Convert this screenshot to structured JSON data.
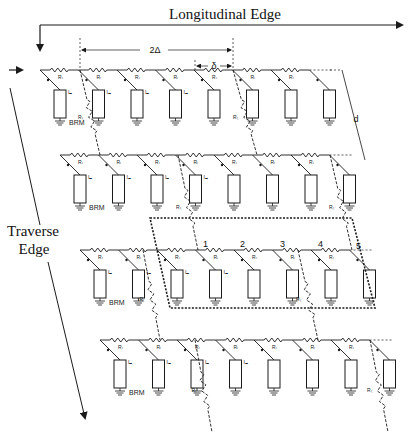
{
  "labels": {
    "longitudinal_edge": "Longitudinal Edge",
    "traverse_edge_line1": "Traverse",
    "traverse_edge_line2": "Edge",
    "dim_2delta": "2Δ",
    "dim_delta": "δ",
    "dim_d": "d",
    "brm": "BRM",
    "resistor_long": "Rₗ",
    "resistor_trans": "Rₜ",
    "current": "Iₘ"
  },
  "node_numbers": [
    "1",
    "2",
    "3",
    "4",
    "5"
  ],
  "rows": [
    {
      "y": 70,
      "x_start": 40,
      "x_end": 330,
      "shift": 0,
      "units": 8,
      "brm_label_unit": 0
    },
    {
      "y": 155,
      "x_start": 60,
      "x_end": 365,
      "shift": 20,
      "units": 8,
      "brm_label_unit": 0
    },
    {
      "y": 250,
      "x_start": 80,
      "x_end": 385,
      "shift": 40,
      "units": 8,
      "brm_label_unit": 0
    },
    {
      "y": 340,
      "x_start": 100,
      "x_end": 405,
      "shift": 60,
      "units": 8,
      "brm_label_unit": 0
    }
  ],
  "colors": {
    "ink": "#1a1a1a",
    "paper": "#ffffff"
  }
}
